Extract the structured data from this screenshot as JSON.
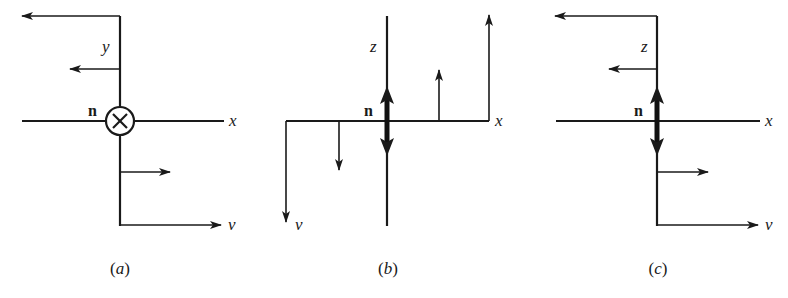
{
  "figure": {
    "panels": [
      {
        "id": "a",
        "caption_open": "(",
        "caption_letter": "a",
        "caption_close": ")",
        "axis_labels": {
          "vertical": "y",
          "horizontal": "x",
          "displacement": "v"
        },
        "normal_label": "n",
        "normal_symbol": "circled-cross (into page)",
        "arrows": [
          {
            "from": [
              120,
              16
            ],
            "to": [
              22,
              16
            ],
            "role": "top-left-displacement"
          },
          {
            "from": [
              120,
              69
            ],
            "to": [
              70,
              69
            ],
            "role": "small-left-displacement"
          },
          {
            "from": [
              120,
              172
            ],
            "to": [
              170,
              172
            ],
            "role": "small-right-displacement"
          },
          {
            "from": [
              120,
              225
            ],
            "to": [
              221,
              225
            ],
            "role": "bottom-right-displacement"
          }
        ]
      },
      {
        "id": "b",
        "caption_open": "(",
        "caption_letter": "b",
        "caption_close": ")",
        "axis_labels": {
          "vertical": "z",
          "horizontal": "x",
          "displacement": "v"
        },
        "normal_label": "n",
        "normal_symbol": "double-headed arrow (in plane)",
        "arrows": [
          {
            "from": [
              286,
              121
            ],
            "to": [
              286,
              222
            ],
            "role": "left-down-displacement"
          },
          {
            "from": [
              339,
              121
            ],
            "to": [
              339,
              170
            ],
            "role": "small-down-displacement"
          },
          {
            "from": [
              439,
              121
            ],
            "to": [
              439,
              70
            ],
            "role": "small-up-displacement"
          },
          {
            "from": [
              489,
              121
            ],
            "to": [
              489,
              15
            ],
            "role": "right-up-displacement"
          }
        ]
      },
      {
        "id": "c",
        "caption_open": "(",
        "caption_letter": "c",
        "caption_close": ")",
        "axis_labels": {
          "vertical": "z",
          "horizontal": "x",
          "displacement": "v"
        },
        "normal_label": "n",
        "normal_symbol": "double-headed arrow (in plane)",
        "arrows": [
          {
            "from": [
              657,
              16
            ],
            "to": [
              555,
              16
            ],
            "role": "top-left-displacement"
          },
          {
            "from": [
              657,
              69
            ],
            "to": [
              609,
              69
            ],
            "role": "small-left-displacement"
          },
          {
            "from": [
              657,
              172
            ],
            "to": [
              708,
              172
            ],
            "role": "small-right-displacement"
          },
          {
            "from": [
              657,
              225
            ],
            "to": [
              758,
              225
            ],
            "role": "bottom-right-displacement"
          }
        ]
      }
    ],
    "colors": {
      "ink": "#1a1a1a",
      "background": "#ffffff"
    }
  }
}
